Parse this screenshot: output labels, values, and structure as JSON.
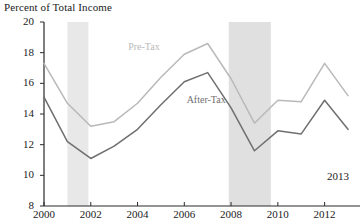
{
  "chart_data": {
    "type": "line",
    "title": "Percent of Total Income",
    "xlabel": "",
    "ylabel": "",
    "x": [
      2000,
      2001,
      2002,
      2003,
      2004,
      2005,
      2006,
      2007,
      2008,
      2009,
      2010,
      2011,
      2012,
      2013
    ],
    "xlim": [
      2000,
      2013
    ],
    "ylim": [
      8,
      20
    ],
    "yticks": [
      8,
      10,
      12,
      14,
      16,
      18,
      20
    ],
    "ytick_labels": [
      "8",
      "10",
      "12",
      "14",
      "16",
      "18",
      "20"
    ],
    "xticks": [
      2000,
      2002,
      2004,
      2006,
      2008,
      2010,
      2012
    ],
    "xtick_labels": [
      "2000",
      "2002",
      "2004",
      "2006",
      "2008",
      "2010",
      "2012"
    ],
    "grid": false,
    "legend_position": "inline-annotation",
    "series": [
      {
        "name": "Pre-Tax",
        "color": "#b9b9b9",
        "values": [
          17.3,
          14.7,
          13.2,
          13.5,
          14.7,
          16.4,
          17.9,
          18.6,
          16.3,
          13.4,
          14.9,
          14.8,
          17.3,
          15.2
        ]
      },
      {
        "name": "After-Tax",
        "color": "#6f6f6f",
        "values": [
          15.1,
          12.2,
          11.1,
          11.9,
          13.0,
          14.6,
          16.1,
          16.7,
          14.4,
          11.6,
          12.9,
          12.7,
          14.9,
          13.0
        ]
      }
    ],
    "shaded_regions": [
      {
        "name": "recession-2001",
        "x_start": 2001.0,
        "x_end": 2001.9,
        "color": "#e8e8e8"
      },
      {
        "name": "recession-2008",
        "x_start": 2007.9,
        "x_end": 2009.7,
        "color": "#e0e0e0"
      }
    ],
    "annotations": [
      {
        "name": "year-2013",
        "text": "2013",
        "x": 2012.1,
        "y": 9.9
      }
    ],
    "series_labels": [
      {
        "name": "Pre-Tax",
        "text": "Pre-Tax",
        "x": 2003.6,
        "y": 18.4
      },
      {
        "name": "After-Tax",
        "text": "After-Tax",
        "x": 2006.1,
        "y": 14.9
      }
    ]
  }
}
